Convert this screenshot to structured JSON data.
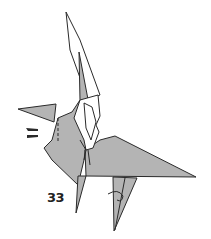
{
  "diagram": {
    "step_number": "33",
    "colors": {
      "paper_colored": "#b4b4b4",
      "paper_white": "#ffffff",
      "line": "#2a2a2a",
      "background": "#ffffff"
    },
    "symbols": [
      "push-arrows",
      "valley-fold-dashed-line",
      "rotate-arrow"
    ]
  }
}
